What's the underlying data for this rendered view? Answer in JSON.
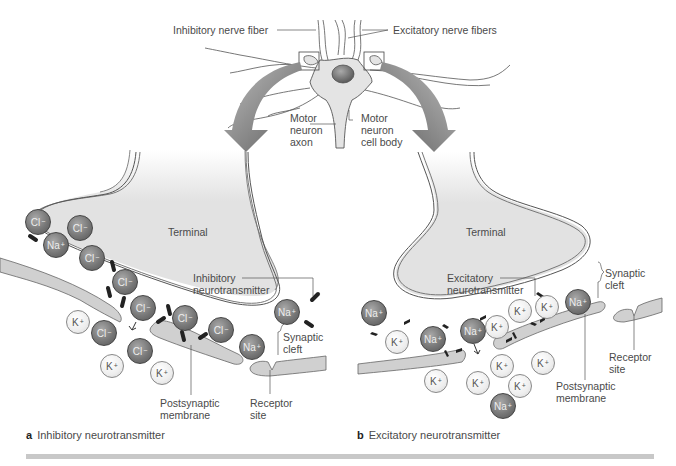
{
  "labels": {
    "inhibitory_fiber": "Inhibitory nerve fiber",
    "excitatory_fibers": "Excitatory nerve fibers",
    "motor_axon": [
      "Motor",
      "neuron",
      "axon"
    ],
    "motor_cell_body": [
      "Motor",
      "neuron",
      "cell body"
    ],
    "left": {
      "terminal": "Terminal",
      "neurotransmitter": [
        "Inhibitory",
        "neurotransmitter"
      ],
      "synaptic_cleft": [
        "Synaptic",
        "cleft"
      ],
      "postsynaptic": [
        "Postsynaptic",
        "membrane"
      ],
      "receptor": [
        "Receptor",
        "site"
      ]
    },
    "right": {
      "terminal": "Terminal",
      "neurotransmitter": [
        "Excitatory",
        "neurotransmitter"
      ],
      "synaptic_cleft": [
        "Synaptic",
        "cleft"
      ],
      "postsynaptic": [
        "Postsynaptic",
        "membrane"
      ],
      "receptor": [
        "Receptor",
        "site"
      ]
    }
  },
  "captions": {
    "a": {
      "letter": "a",
      "text": "Inhibitory neurotransmitter"
    },
    "b": {
      "letter": "b",
      "text": "Excitatory neurotransmitter"
    }
  },
  "ions": {
    "left": [
      {
        "sym": "Cl",
        "charge": "−",
        "type": "dark",
        "x": 38,
        "y": 222
      },
      {
        "sym": "Cl",
        "charge": "−",
        "type": "dark",
        "x": 80,
        "y": 228
      },
      {
        "sym": "Na",
        "charge": "+",
        "type": "dark",
        "x": 56,
        "y": 245
      },
      {
        "sym": "Cl",
        "charge": "−",
        "type": "dark",
        "x": 92,
        "y": 258
      },
      {
        "sym": "Cl",
        "charge": "−",
        "type": "dark",
        "x": 125,
        "y": 282
      },
      {
        "sym": "Cl",
        "charge": "−",
        "type": "dark",
        "x": 143,
        "y": 308
      },
      {
        "sym": "Cl",
        "charge": "−",
        "type": "dark",
        "x": 185,
        "y": 318
      },
      {
        "sym": "Cl",
        "charge": "−",
        "type": "dark",
        "x": 221,
        "y": 330
      },
      {
        "sym": "Na",
        "charge": "+",
        "type": "dark",
        "x": 252,
        "y": 347
      },
      {
        "sym": "Na",
        "charge": "+",
        "type": "dark",
        "x": 287,
        "y": 312
      },
      {
        "sym": "Cl",
        "charge": "−",
        "type": "dark",
        "x": 104,
        "y": 333
      },
      {
        "sym": "Cl",
        "charge": "−",
        "type": "dark",
        "x": 140,
        "y": 351
      },
      {
        "sym": "K",
        "charge": "+",
        "type": "light",
        "x": 78,
        "y": 322
      },
      {
        "sym": "K",
        "charge": "+",
        "type": "light",
        "x": 112,
        "y": 366
      },
      {
        "sym": "K",
        "charge": "+",
        "type": "light",
        "x": 162,
        "y": 373
      }
    ],
    "right": [
      {
        "sym": "Na",
        "charge": "+",
        "type": "dark",
        "x": 374,
        "y": 313
      },
      {
        "sym": "K",
        "charge": "+",
        "type": "light",
        "x": 397,
        "y": 342
      },
      {
        "sym": "Na",
        "charge": "+",
        "type": "dark",
        "x": 433,
        "y": 339
      },
      {
        "sym": "Na",
        "charge": "+",
        "type": "dark",
        "x": 473,
        "y": 331
      },
      {
        "sym": "K",
        "charge": "+",
        "type": "light",
        "x": 497,
        "y": 327
      },
      {
        "sym": "K",
        "charge": "+",
        "type": "light",
        "x": 520,
        "y": 311
      },
      {
        "sym": "K",
        "charge": "+",
        "type": "light",
        "x": 547,
        "y": 307
      },
      {
        "sym": "Na",
        "charge": "+",
        "type": "dark",
        "x": 578,
        "y": 302
      },
      {
        "sym": "K",
        "charge": "+",
        "type": "light",
        "x": 502,
        "y": 366
      },
      {
        "sym": "K",
        "charge": "+",
        "type": "light",
        "x": 543,
        "y": 363
      },
      {
        "sym": "K",
        "charge": "+",
        "type": "light",
        "x": 436,
        "y": 381
      },
      {
        "sym": "K",
        "charge": "+",
        "type": "light",
        "x": 478,
        "y": 383
      },
      {
        "sym": "K",
        "charge": "+",
        "type": "light",
        "x": 520,
        "y": 386
      },
      {
        "sym": "Na",
        "charge": "+",
        "type": "dark",
        "x": 503,
        "y": 406
      }
    ]
  },
  "colors": {
    "terminal_fill": "#e2e2e2",
    "membrane_fill": "#d0d0d0",
    "arrow_fill": "#7a7a7a",
    "outline": "#555555",
    "caption_bar": "#c8c8c8"
  }
}
